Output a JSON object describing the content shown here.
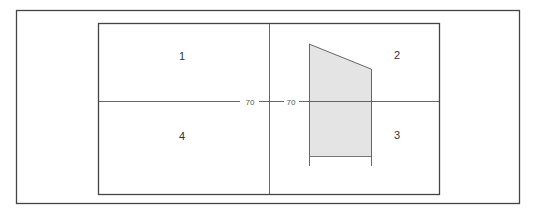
{
  "diagram": {
    "quadrants": [
      {
        "id": "1",
        "label": "1"
      },
      {
        "id": "2",
        "label": "2"
      },
      {
        "id": "3",
        "label": "3"
      },
      {
        "id": "4",
        "label": "4"
      }
    ],
    "axis_labels": {
      "left": "70",
      "right": "70"
    },
    "colors": {
      "frame": "#444444",
      "axis": "#555555",
      "shape_fill": "#e4e4e4",
      "shape_stroke": "#666666"
    }
  }
}
